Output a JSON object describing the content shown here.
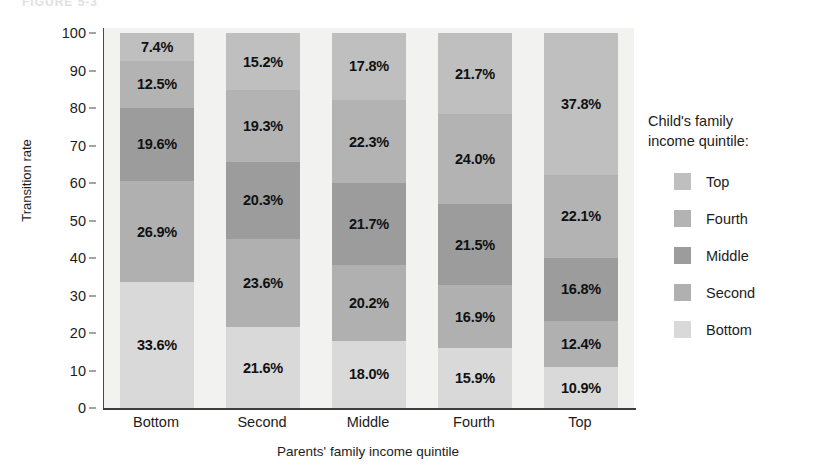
{
  "figure": {
    "caption": "FIGURE 5-3"
  },
  "chart_data": {
    "type": "bar",
    "subtype": "stacked-100-percent",
    "title": "",
    "xlabel": "Parents' family income quintile",
    "ylabel": "Transition rate",
    "categories": [
      "Bottom",
      "Second",
      "Middle",
      "Fourth",
      "Top"
    ],
    "ylim": [
      0,
      100
    ],
    "yticks": [
      0,
      10,
      20,
      30,
      40,
      50,
      60,
      70,
      80,
      90,
      100
    ],
    "grid": false,
    "legend_position": "right",
    "legend_title": "Child's family income quintile:",
    "stack_order_bottom_to_top": [
      "Bottom",
      "Second",
      "Middle",
      "Fourth",
      "Top"
    ],
    "series": [
      {
        "name": "Top",
        "color": "#bfbfbf",
        "values": [
          7.4,
          15.2,
          17.8,
          21.7,
          37.8
        ],
        "labels": [
          "7.4%",
          "15.2%",
          "17.8%",
          "21.7%",
          "37.8%"
        ]
      },
      {
        "name": "Fourth",
        "color": "#b3b3b3",
        "values": [
          12.5,
          19.3,
          22.3,
          24.0,
          22.1
        ],
        "labels": [
          "12.5%",
          "19.3%",
          "22.3%",
          "24.0%",
          "22.1%"
        ]
      },
      {
        "name": "Middle",
        "color": "#9c9c9c",
        "values": [
          19.6,
          20.3,
          21.7,
          21.5,
          16.8
        ],
        "labels": [
          "19.6%",
          "20.3%",
          "21.7%",
          "21.5%",
          "16.8%"
        ]
      },
      {
        "name": "Second",
        "color": "#b0b0b0",
        "values": [
          26.9,
          23.6,
          20.2,
          16.9,
          12.4
        ],
        "labels": [
          "26.9%",
          "23.6%",
          "20.2%",
          "16.9%",
          "12.4%"
        ]
      },
      {
        "name": "Bottom",
        "color": "#d9d9d9",
        "values": [
          33.6,
          21.6,
          18.0,
          15.9,
          10.9
        ],
        "labels": [
          "33.6%",
          "21.6%",
          "18.0%",
          "15.9%",
          "10.9%"
        ]
      }
    ]
  },
  "legend": {
    "title_line1": "Child's family",
    "title_line2": "income quintile:",
    "items": [
      {
        "label": "Top",
        "color": "#bfbfbf"
      },
      {
        "label": "Fourth",
        "color": "#b3b3b3"
      },
      {
        "label": "Middle",
        "color": "#9c9c9c"
      },
      {
        "label": "Second",
        "color": "#b0b0b0"
      },
      {
        "label": "Bottom",
        "color": "#d9d9d9"
      }
    ]
  }
}
